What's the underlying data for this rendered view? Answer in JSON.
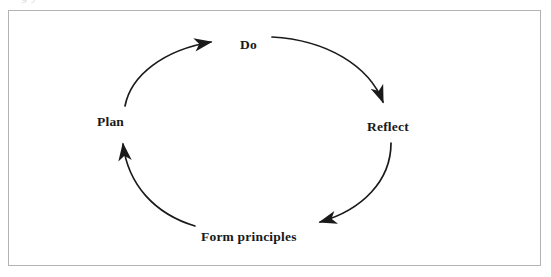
{
  "figure": {
    "type": "cycle-diagram",
    "caption_fragment": "g y",
    "background_color": "#ffffff",
    "frame_color": "#b3b3b3",
    "stroke_color": "#1a1a1a",
    "text_color": "#191919"
  },
  "diagram": {
    "title": "",
    "direction": "clockwise",
    "nodes": [
      {
        "id": "do",
        "label": "Do",
        "position": "top"
      },
      {
        "id": "reflect",
        "label": "Reflect",
        "position": "right"
      },
      {
        "id": "form",
        "label": "Form principles",
        "position": "bottom"
      },
      {
        "id": "plan",
        "label": "Plan",
        "position": "left"
      }
    ],
    "arrows": [
      {
        "from": "plan",
        "to": "do",
        "head": "right"
      },
      {
        "from": "do",
        "to": "reflect",
        "head": "down-right"
      },
      {
        "from": "reflect",
        "to": "form",
        "head": "left"
      },
      {
        "from": "form",
        "to": "plan",
        "head": "up"
      }
    ]
  }
}
